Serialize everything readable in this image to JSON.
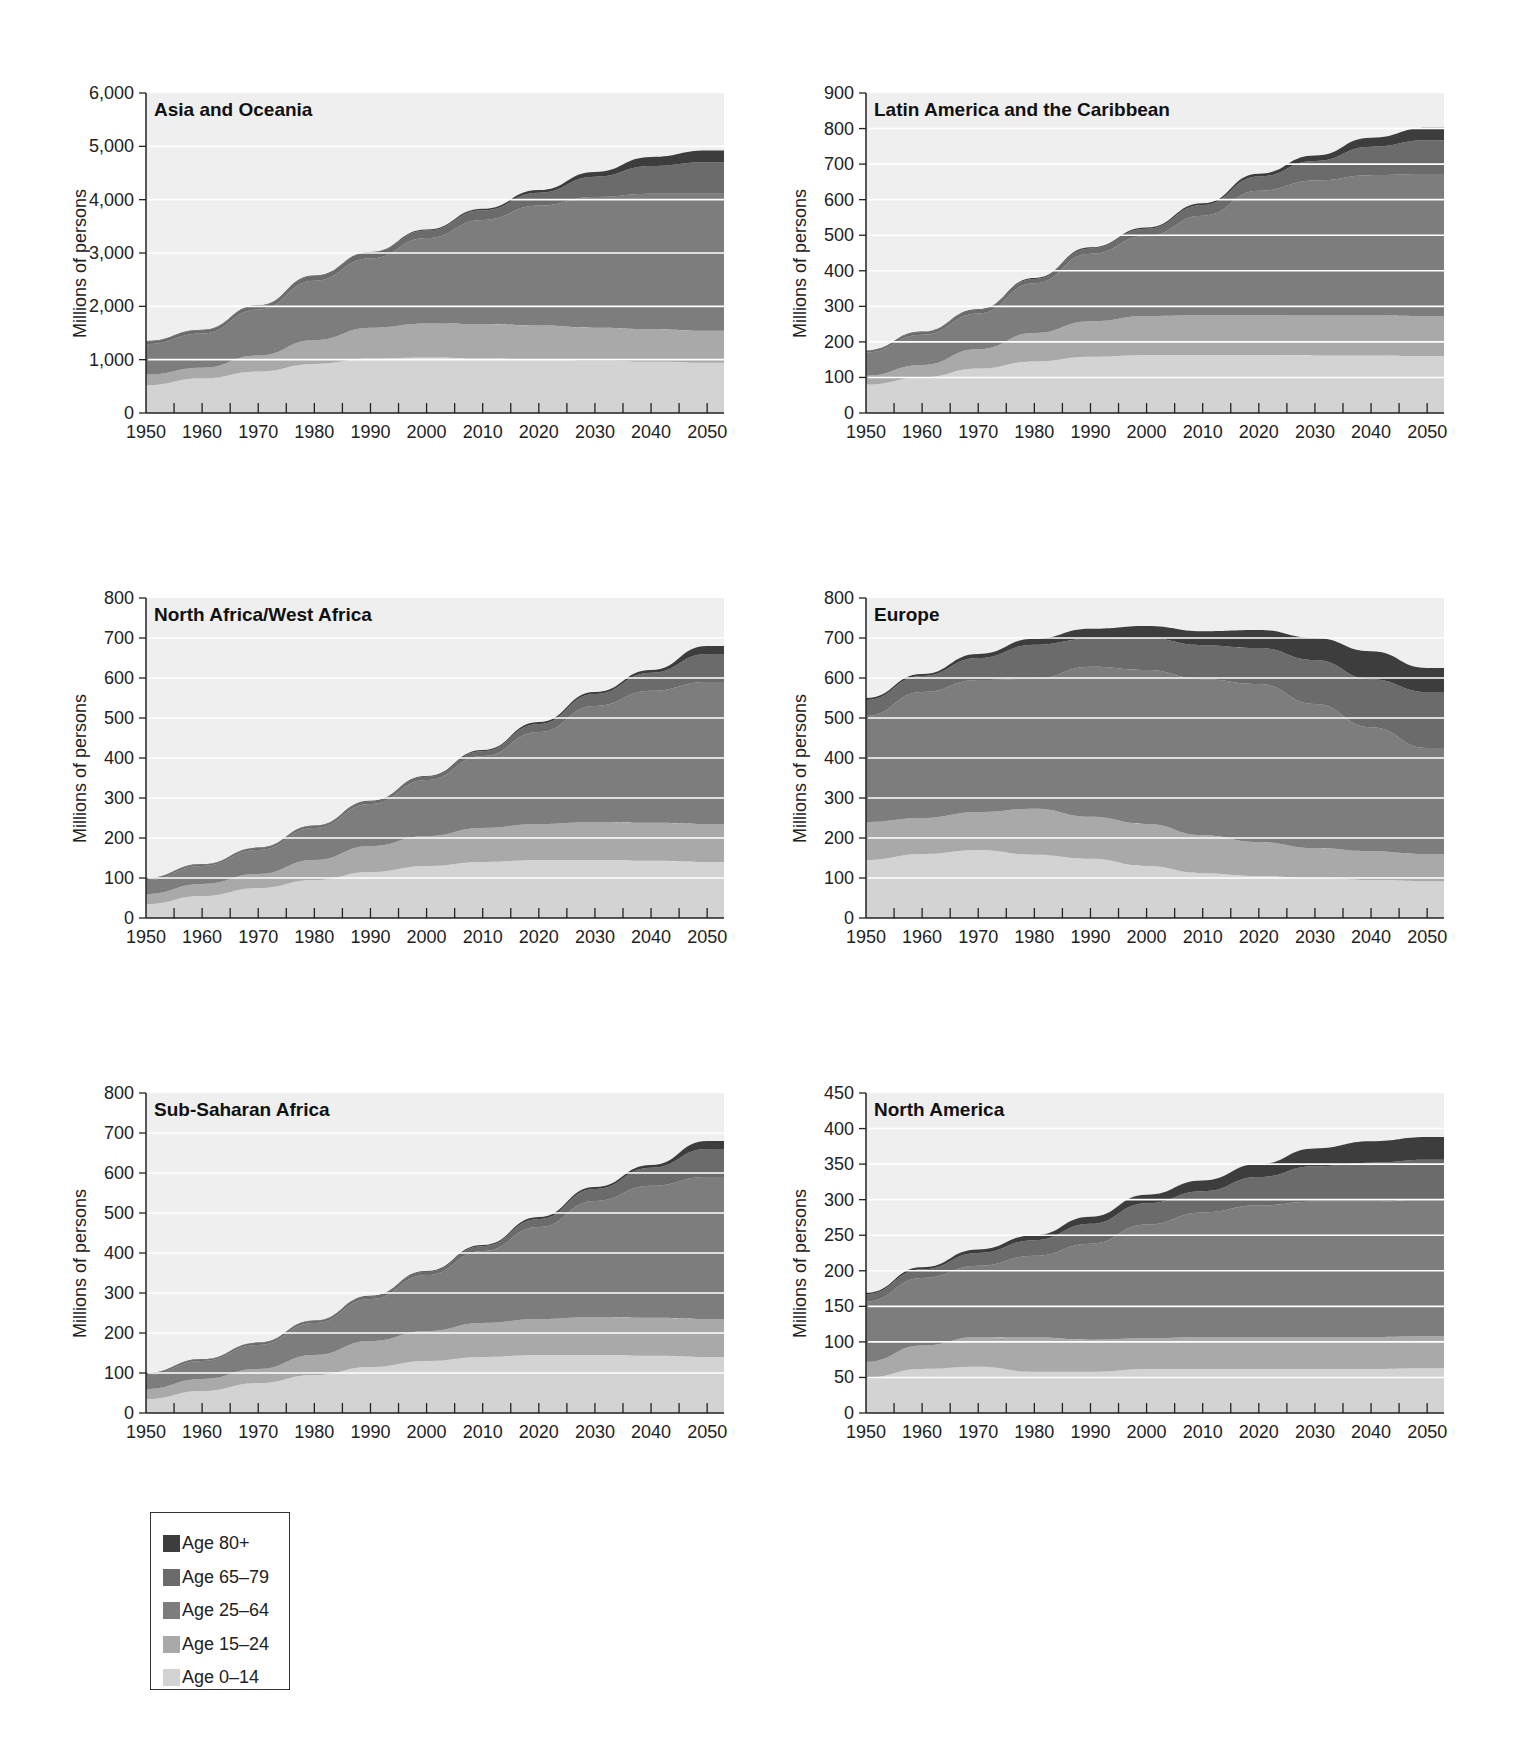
{
  "legend": {
    "items": [
      {
        "label": "Age 80+",
        "color": "#3d3d3d"
      },
      {
        "label": "Age 65–79",
        "color": "#6b6b6b"
      },
      {
        "label": "Age 25–64",
        "color": "#7d7d7d"
      },
      {
        "label": "Age 15–24",
        "color": "#a9a9a9"
      },
      {
        "label": "Age 0–14",
        "color": "#d3d3d3"
      }
    ]
  },
  "chart_data": [
    {
      "type": "area",
      "stacked": true,
      "title": "Asia and Oceania",
      "xlabel": "",
      "ylabel": "Millions of persons",
      "ylim": [
        0,
        6000
      ],
      "yticks": [
        0,
        1000,
        2000,
        3000,
        4000,
        5000,
        6000
      ],
      "ytick_labels": [
        "0",
        "1,000",
        "2,000",
        "3,000",
        "4,000",
        "5,000",
        "6,000"
      ],
      "x": [
        1950,
        1960,
        1970,
        1980,
        1990,
        2000,
        2010,
        2020,
        2030,
        2040,
        2050
      ],
      "xtick_labels": [
        "1950",
        "1960",
        "1970",
        "1980",
        "1990",
        "2000",
        "2010",
        "2020",
        "2030",
        "2040",
        "2050"
      ],
      "grid": true,
      "series": [
        {
          "name": "Age 0–14",
          "values": [
            520,
            650,
            780,
            920,
            1020,
            1040,
            1020,
            1000,
            980,
            960,
            940
          ]
        },
        {
          "name": "Age 15–24",
          "values": [
            200,
            200,
            300,
            450,
            580,
            640,
            650,
            640,
            620,
            610,
            600
          ]
        },
        {
          "name": "Age 25–64",
          "values": [
            570,
            640,
            860,
            1110,
            1300,
            1600,
            1950,
            2250,
            2450,
            2540,
            2570
          ]
        },
        {
          "name": "Age 65–79",
          "values": [
            50,
            60,
            70,
            90,
            110,
            140,
            180,
            240,
            380,
            520,
            590
          ]
        },
        {
          "name": "Age 80+",
          "values": [
            10,
            10,
            10,
            10,
            10,
            20,
            30,
            50,
            90,
            170,
            220
          ]
        }
      ]
    },
    {
      "type": "area",
      "stacked": true,
      "title": "Latin America and the Caribbean",
      "xlabel": "",
      "ylabel": "Millions of persons",
      "ylim": [
        0,
        900
      ],
      "yticks": [
        0,
        100,
        200,
        300,
        400,
        500,
        600,
        700,
        800,
        900
      ],
      "ytick_labels": [
        "0",
        "100",
        "200",
        "300",
        "400",
        "500",
        "600",
        "700",
        "800",
        "900"
      ],
      "x": [
        1950,
        1960,
        1970,
        1980,
        1990,
        2000,
        2010,
        2020,
        2030,
        2040,
        2050
      ],
      "xtick_labels": [
        "1950",
        "1960",
        "1970",
        "1980",
        "1990",
        "2000",
        "2010",
        "2020",
        "2030",
        "2040",
        "2050"
      ],
      "grid": true,
      "series": [
        {
          "name": "Age 0–14",
          "values": [
            80,
            100,
            125,
            145,
            158,
            163,
            163,
            163,
            162,
            162,
            160
          ]
        },
        {
          "name": "Age 15–24",
          "values": [
            25,
            35,
            55,
            80,
            100,
            110,
            112,
            112,
            112,
            112,
            112
          ]
        },
        {
          "name": "Age 25–64",
          "values": [
            65,
            85,
            100,
            140,
            190,
            225,
            280,
            350,
            380,
            395,
            400
          ]
        },
        {
          "name": "Age 65–79",
          "values": [
            5,
            8,
            10,
            12,
            15,
            20,
            30,
            40,
            55,
            80,
            95
          ]
        },
        {
          "name": "Age 80+",
          "values": [
            1,
            1,
            2,
            3,
            3,
            4,
            5,
            8,
            15,
            25,
            35
          ]
        }
      ]
    },
    {
      "type": "area",
      "stacked": true,
      "title": "North Africa/West Africa",
      "xlabel": "",
      "ylabel": "Millions of persons",
      "ylim": [
        0,
        800
      ],
      "yticks": [
        0,
        100,
        200,
        300,
        400,
        500,
        600,
        700,
        800
      ],
      "ytick_labels": [
        "0",
        "100",
        "200",
        "300",
        "400",
        "500",
        "600",
        "700",
        "800"
      ],
      "x": [
        1950,
        1960,
        1970,
        1980,
        1990,
        2000,
        2010,
        2020,
        2030,
        2040,
        2050
      ],
      "xtick_labels": [
        "1950",
        "1960",
        "1970",
        "1980",
        "1990",
        "2000",
        "2010",
        "2020",
        "2030",
        "2040",
        "2050"
      ],
      "grid": true,
      "series": [
        {
          "name": "Age 0–14",
          "values": [
            35,
            55,
            75,
            95,
            115,
            130,
            140,
            145,
            145,
            143,
            140
          ]
        },
        {
          "name": "Age 15–24",
          "values": [
            25,
            30,
            35,
            50,
            65,
            75,
            85,
            90,
            95,
            95,
            95
          ]
        },
        {
          "name": "Age 25–64",
          "values": [
            35,
            45,
            60,
            80,
            105,
            140,
            180,
            230,
            290,
            330,
            355
          ]
        },
        {
          "name": "Age 65–79",
          "values": [
            4,
            4,
            5,
            5,
            6,
            8,
            12,
            20,
            30,
            45,
            70
          ]
        },
        {
          "name": "Age 80+",
          "values": [
            1,
            1,
            1,
            1,
            2,
            2,
            3,
            5,
            5,
            7,
            20
          ]
        }
      ]
    },
    {
      "type": "area",
      "stacked": true,
      "title": "Europe",
      "xlabel": "",
      "ylabel": "Millions of persons",
      "ylim": [
        0,
        800
      ],
      "yticks": [
        0,
        100,
        200,
        300,
        400,
        500,
        600,
        700,
        800
      ],
      "ytick_labels": [
        "0",
        "100",
        "200",
        "300",
        "400",
        "500",
        "600",
        "700",
        "800"
      ],
      "x": [
        1950,
        1960,
        1970,
        1980,
        1990,
        2000,
        2010,
        2020,
        2030,
        2040,
        2050
      ],
      "xtick_labels": [
        "1950",
        "1960",
        "1970",
        "1980",
        "1990",
        "2000",
        "2010",
        "2020",
        "2030",
        "2040",
        "2050"
      ],
      "grid": true,
      "series": [
        {
          "name": "Age 0–14",
          "values": [
            145,
            160,
            170,
            158,
            148,
            130,
            112,
            105,
            100,
            95,
            92
          ]
        },
        {
          "name": "Age 15–24",
          "values": [
            95,
            90,
            95,
            115,
            105,
            105,
            95,
            85,
            75,
            72,
            68
          ]
        },
        {
          "name": "Age 25–64",
          "values": [
            265,
            315,
            330,
            325,
            375,
            385,
            390,
            395,
            360,
            310,
            265
          ]
        },
        {
          "name": "Age 65–79",
          "values": [
            40,
            40,
            55,
            85,
            70,
            80,
            85,
            90,
            110,
            120,
            140
          ]
        },
        {
          "name": "Age 80+",
          "values": [
            5,
            5,
            10,
            15,
            25,
            30,
            35,
            45,
            55,
            70,
            60
          ]
        }
      ]
    },
    {
      "type": "area",
      "stacked": true,
      "title": "Sub-Saharan Africa",
      "xlabel": "",
      "ylabel": "Millions of persons",
      "ylim": [
        0,
        800
      ],
      "yticks": [
        0,
        100,
        200,
        300,
        400,
        500,
        600,
        700,
        800
      ],
      "ytick_labels": [
        "0",
        "100",
        "200",
        "300",
        "400",
        "500",
        "600",
        "700",
        "800"
      ],
      "x": [
        1950,
        1960,
        1970,
        1980,
        1990,
        2000,
        2010,
        2020,
        2030,
        2040,
        2050
      ],
      "xtick_labels": [
        "1950",
        "1960",
        "1970",
        "1980",
        "1990",
        "2000",
        "2010",
        "2020",
        "2030",
        "2040",
        "2050"
      ],
      "grid": true,
      "series": [
        {
          "name": "Age 0–14",
          "values": [
            35,
            55,
            75,
            95,
            115,
            130,
            140,
            145,
            145,
            143,
            140
          ]
        },
        {
          "name": "Age 15–24",
          "values": [
            25,
            30,
            35,
            50,
            65,
            75,
            85,
            90,
            95,
            95,
            95
          ]
        },
        {
          "name": "Age 25–64",
          "values": [
            35,
            45,
            60,
            80,
            105,
            140,
            180,
            230,
            290,
            330,
            355
          ]
        },
        {
          "name": "Age 65–79",
          "values": [
            4,
            4,
            5,
            5,
            6,
            8,
            12,
            20,
            30,
            45,
            70
          ]
        },
        {
          "name": "Age 80+",
          "values": [
            1,
            1,
            1,
            1,
            2,
            2,
            3,
            5,
            5,
            7,
            20
          ]
        }
      ]
    },
    {
      "type": "area",
      "stacked": true,
      "title": "North America",
      "xlabel": "",
      "ylabel": "Millions of persons",
      "ylim": [
        0,
        450
      ],
      "yticks": [
        0,
        50,
        100,
        150,
        200,
        250,
        300,
        350,
        400,
        450
      ],
      "ytick_labels": [
        "0",
        "50",
        "100",
        "150",
        "200",
        "250",
        "300",
        "350",
        "400",
        "450"
      ],
      "x": [
        1950,
        1960,
        1970,
        1980,
        1990,
        2000,
        2010,
        2020,
        2030,
        2040,
        2050
      ],
      "xtick_labels": [
        "1950",
        "1960",
        "1970",
        "1980",
        "1990",
        "2000",
        "2010",
        "2020",
        "2030",
        "2040",
        "2050"
      ],
      "grid": true,
      "series": [
        {
          "name": "Age 0–14",
          "values": [
            50,
            62,
            65,
            58,
            58,
            62,
            62,
            62,
            62,
            62,
            63
          ]
        },
        {
          "name": "Age 15–24",
          "values": [
            22,
            33,
            42,
            48,
            45,
            43,
            45,
            45,
            45,
            45,
            45
          ]
        },
        {
          "name": "Age 25–64",
          "values": [
            85,
            95,
            100,
            115,
            135,
            160,
            175,
            185,
            190,
            190,
            193
          ]
        },
        {
          "name": "Age 65–79",
          "values": [
            10,
            12,
            18,
            22,
            28,
            30,
            30,
            40,
            50,
            55,
            55
          ]
        },
        {
          "name": "Age 80+",
          "values": [
            2,
            3,
            5,
            7,
            10,
            12,
            15,
            18,
            25,
            30,
            32
          ]
        }
      ]
    }
  ]
}
